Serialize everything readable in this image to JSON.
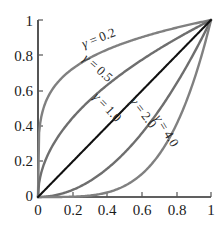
{
  "chart_data": {
    "type": "line",
    "title": "",
    "xlabel": "",
    "ylabel": "",
    "xlim": [
      0,
      1
    ],
    "ylim": [
      0,
      1
    ],
    "grid": false,
    "legend_position": "inline-along-curves",
    "x_ticks": [
      "0",
      "0.2",
      "0.4",
      "0.6",
      "0.8",
      "1"
    ],
    "x_tick_values": [
      0,
      0.2,
      0.4,
      0.6,
      0.8,
      1
    ],
    "y_ticks": [
      "0",
      "0.2",
      "0.4",
      "0.6",
      "0.8",
      "1"
    ],
    "y_tick_values": [
      0,
      0.2,
      0.4,
      0.6,
      0.8,
      1
    ],
    "function": "y = x^gamma",
    "series": [
      {
        "name": "gamma = 0.2",
        "gamma": 0.2,
        "color": "#808080",
        "x": [
          0,
          0.02,
          0.05,
          0.1,
          0.2,
          0.3,
          0.4,
          0.5,
          0.6,
          0.7,
          0.8,
          0.9,
          1
        ],
        "values": [
          0,
          0.457,
          0.549,
          0.631,
          0.725,
          0.786,
          0.833,
          0.871,
          0.903,
          0.93,
          0.956,
          0.979,
          1
        ]
      },
      {
        "name": "gamma = 0.5",
        "gamma": 0.5,
        "color": "#6e6e6e",
        "x": [
          0,
          0.05,
          0.1,
          0.2,
          0.3,
          0.4,
          0.5,
          0.6,
          0.7,
          0.8,
          0.9,
          1
        ],
        "values": [
          0,
          0.224,
          0.316,
          0.447,
          0.548,
          0.632,
          0.707,
          0.775,
          0.837,
          0.894,
          0.949,
          1
        ]
      },
      {
        "name": "gamma = 1.0",
        "gamma": 1.0,
        "color": "#111111",
        "x": [
          0,
          0.2,
          0.4,
          0.6,
          0.8,
          1
        ],
        "values": [
          0,
          0.2,
          0.4,
          0.6,
          0.8,
          1
        ]
      },
      {
        "name": "gamma = 2.0",
        "gamma": 2.0,
        "color": "#6e6e6e",
        "x": [
          0,
          0.1,
          0.2,
          0.3,
          0.4,
          0.5,
          0.6,
          0.7,
          0.8,
          0.9,
          0.95,
          1
        ],
        "values": [
          0,
          0.01,
          0.04,
          0.09,
          0.16,
          0.25,
          0.36,
          0.49,
          0.64,
          0.81,
          0.903,
          1
        ]
      },
      {
        "name": "gamma = 4.0",
        "gamma": 4.0,
        "color": "#808080",
        "x": [
          0,
          0.2,
          0.3,
          0.4,
          0.5,
          0.6,
          0.7,
          0.8,
          0.9,
          0.95,
          0.98,
          1
        ],
        "values": [
          0,
          0.0016,
          0.008,
          0.026,
          0.063,
          0.13,
          0.24,
          0.41,
          0.656,
          0.815,
          0.922,
          1
        ]
      }
    ],
    "annotations": [
      {
        "id": "label-gamma-02",
        "symbol": "γ",
        "equals": "=",
        "value": "0.2",
        "rotation": -21,
        "x": 100,
        "y": 42
      },
      {
        "id": "label-gamma-05",
        "symbol": "γ",
        "equals": "=",
        "value": "0.5",
        "rotation": 42,
        "x": 95,
        "y": 71
      },
      {
        "id": "label-gamma-10",
        "symbol": "γ",
        "equals": "=",
        "value": "1.0",
        "rotation": 47,
        "x": 104,
        "y": 110
      },
      {
        "id": "label-gamma-20",
        "symbol": "γ",
        "equals": "=",
        "value": "2.0",
        "rotation": 53,
        "x": 140,
        "y": 115
      },
      {
        "id": "label-gamma-40",
        "symbol": "γ",
        "equals": "=",
        "value": "4.0",
        "rotation": 59,
        "x": 163,
        "y": 133
      }
    ]
  },
  "colors": {
    "background": "#ffffff",
    "axis": "#2b2b2b",
    "tick_text": "#1a1a1a",
    "identity_line": "#111111",
    "curve_gray_light": "#808080",
    "curve_gray_dark": "#6e6e6e"
  }
}
